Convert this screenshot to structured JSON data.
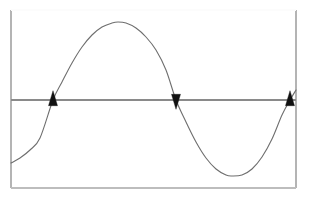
{
  "figure": {
    "title": "",
    "background_color": "#ffffff",
    "width": 310,
    "height": 199
  },
  "frame": {
    "name": "plot-border-rectangle",
    "left": 11,
    "top": 10,
    "right": 296,
    "bottom": 188,
    "stroke_color": "#b4b4b4",
    "stroke_width": 1.2,
    "top_edge_color": "#fcfcfc",
    "bottom_edge_color": "#bdbdbd"
  },
  "axis": {
    "name": "horizontal-axis-line",
    "label": "",
    "y": 100,
    "x_start": 11,
    "x_end": 296,
    "stroke_color": "#8a8a8a",
    "stroke_width": 1.1
  },
  "arrowheads": [
    {
      "name": "arrowhead-up-left",
      "x": 53,
      "y": 100,
      "direction": "up",
      "color": "#111111",
      "width": 9,
      "height": 15
    },
    {
      "name": "arrowhead-down-middle",
      "x": 176,
      "y": 100,
      "direction": "down",
      "color": "#111111",
      "width": 9,
      "height": 15
    },
    {
      "name": "arrowhead-up-right",
      "x": 290,
      "y": 100,
      "direction": "up",
      "color": "#111111",
      "width": 9,
      "height": 15
    }
  ],
  "chart_data": {
    "type": "line",
    "title": "",
    "subtitle": "",
    "xlabel": "",
    "ylabel": "",
    "grid": false,
    "legend": [],
    "legend_position": "none",
    "axis_line_value": 0,
    "xlim": [
      11,
      296
    ],
    "ylim": [
      188,
      10
    ],
    "annotations": [
      "Upward arrowhead at left zero crossing",
      "Downward arrowhead at middle zero crossing",
      "Upward arrowhead at right zero crossing"
    ],
    "series": [
      {
        "name": "sine-curve",
        "color": "#6e6e6e",
        "stroke_width": 1.1,
        "x": [
          11,
          20,
          30,
          40,
          53,
          62,
          72,
          82,
          92,
          102,
          112,
          118,
          126,
          136,
          146,
          156,
          166,
          176,
          186,
          196,
          206,
          216,
          226,
          232,
          242,
          252,
          262,
          272,
          282,
          290,
          296
        ],
        "y": [
          163,
          158,
          150,
          138,
          100,
          82,
          63,
          47,
          35,
          27,
          23,
          22,
          23,
          28,
          37,
          50,
          70,
          100,
          122,
          142,
          158,
          169,
          175,
          176,
          175,
          169,
          157,
          139,
          115,
          100,
          90
        ],
        "key_points": {
          "left_start": {
            "x": 11,
            "y": 163
          },
          "zero_crossing_1": {
            "x": 53,
            "y": 100
          },
          "peak": {
            "x": 118,
            "y": 22
          },
          "zero_crossing_2": {
            "x": 176,
            "y": 100
          },
          "trough": {
            "x": 232,
            "y": 176
          },
          "zero_crossing_3": {
            "x": 290,
            "y": 100
          },
          "right_end": {
            "x": 296,
            "y": 90
          }
        }
      }
    ]
  }
}
